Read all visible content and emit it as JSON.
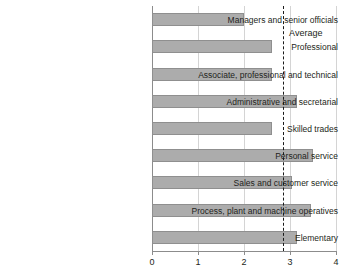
{
  "chart_data": {
    "type": "bar",
    "orientation": "horizontal",
    "title": "",
    "xlabel": "",
    "ylabel": "",
    "xlim": [
      0,
      4
    ],
    "xticks": [
      "0",
      "1",
      "2",
      "3",
      "4"
    ],
    "grid": true,
    "legend": null,
    "categories": [
      "Managers and senior officials",
      "Professional",
      "Associate, professional and technical",
      "Administrative and secretarial",
      "Skilled trades",
      "Personal service",
      "Sales and customer service",
      "Process, plant and machine operatives",
      "Elementary"
    ],
    "values": [
      2.0,
      2.6,
      2.6,
      3.15,
      2.6,
      3.5,
      3.05,
      3.45,
      3.15
    ],
    "annotations": [
      {
        "name": "average-line",
        "label": "Average",
        "value": 2.85,
        "style": "dashed-vertical"
      }
    ],
    "colors": {
      "bar_fill": "#acacac",
      "bar_border": "#8f8f8f",
      "grid": "#d4d4d4",
      "axis": "#8c8c8c",
      "text": "#231f20",
      "average_line": "#1a1a1a"
    }
  }
}
